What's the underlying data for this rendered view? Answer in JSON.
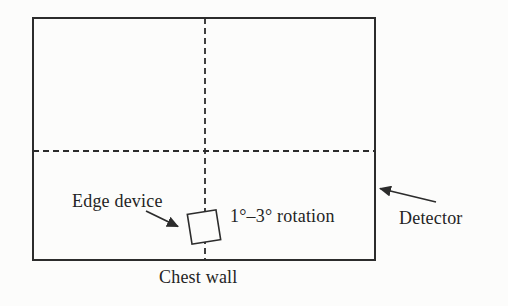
{
  "figure": {
    "labels": {
      "edge_device": "Edge device",
      "rotation": "1°–3° rotation",
      "detector": "Detector",
      "chest_wall": "Chest wall"
    },
    "colors": {
      "line": "#2c2c2c",
      "fill": "#fcfcfb",
      "text": "#242424"
    }
  }
}
